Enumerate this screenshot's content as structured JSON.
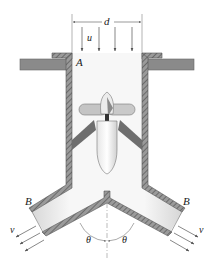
{
  "figure": {
    "type": "engineering-diagram",
    "labels": {
      "diameter": "d",
      "inlet_velocity": "u",
      "inlet_section": "A",
      "outlet_left": "B",
      "outlet_right": "B",
      "outlet_velocity_left": "v",
      "outlet_velocity_right": "v",
      "angle_left": "θ",
      "angle_right": "θ"
    },
    "colors": {
      "wall_fill": "#8c8c8c",
      "wall_hatch": "#5a5a5a",
      "plate": "#8a8a8a",
      "interior": "#f2f2f2",
      "arrow": "#555555",
      "strut": "#6e6e6e",
      "body": "#f4f4f4",
      "text": "#222222"
    },
    "inlet_arrow_count": 4,
    "outlet_arrow_count_each": 3
  }
}
